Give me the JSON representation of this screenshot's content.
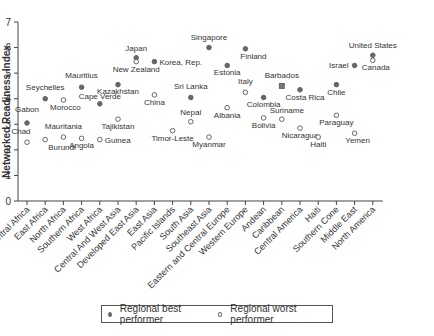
{
  "chart_data": {
    "type": "scatter",
    "title": "",
    "xlabel": "",
    "ylabel": "Networked Readiness Index",
    "ylim": [
      0,
      7
    ],
    "yticks": [
      0,
      1,
      2,
      3,
      4,
      5,
      6,
      7
    ],
    "grid": false,
    "legend_position": "bottom",
    "categories": [
      "Central Africa",
      "East Africa",
      "North Africa",
      "Southern Africa",
      "West Africa",
      "Central And West Asia",
      "Developed East Asia",
      "East Asia",
      "Pacific Islands",
      "South Asia",
      "Southeast Asia",
      "Eastern and Central Europe",
      "Western Europe",
      "Andean",
      "Caribbean",
      "Central America",
      "Haiti",
      "Southern Cone",
      "Middle East",
      "North America"
    ],
    "series": [
      {
        "name": "Regional best performer",
        "marker": "filled",
        "points": [
          {
            "category": "Central Africa",
            "label": "Gabon",
            "value": 3.05
          },
          {
            "category": "East Africa",
            "label": "Seychelles",
            "value": 4.0
          },
          {
            "category": "Southern Africa",
            "label": "Mauritius",
            "value": 4.45
          },
          {
            "category": "West Africa",
            "label": "Cape Verde",
            "value": 3.8
          },
          {
            "category": "Central And West Asia",
            "label": "Kazakhstan",
            "value": 4.55
          },
          {
            "category": "Developed East Asia",
            "label": "Japan",
            "value": 5.6
          },
          {
            "category": "East Asia",
            "label": "Korea, Rep.",
            "value": 5.45
          },
          {
            "category": "South Asia",
            "label": "Sri Lanka",
            "value": 4.05
          },
          {
            "category": "Southeast Asia",
            "label": "Singapore",
            "value": 6.0
          },
          {
            "category": "Eastern and Central Europe",
            "label": "Estonia",
            "value": 5.3
          },
          {
            "category": "Western Europe",
            "label": "Finland",
            "value": 5.95
          },
          {
            "category": "Andean",
            "label": "Colombia",
            "value": 4.05
          },
          {
            "category": "Caribbean",
            "label": "Barbados",
            "value": 4.5
          },
          {
            "category": "Central America",
            "label": "Costa Rica",
            "value": 4.35
          },
          {
            "category": "Southern Cone",
            "label": "Chile",
            "value": 4.55
          },
          {
            "category": "Middle East",
            "label": "Israel",
            "value": 5.3
          },
          {
            "category": "North America",
            "label": "United States",
            "value": 5.7
          }
        ]
      },
      {
        "name": "Regional worst performer",
        "marker": "hollow",
        "points": [
          {
            "category": "Central Africa",
            "label": "Chad",
            "value": 2.3
          },
          {
            "category": "East Africa",
            "label": "Burundi",
            "value": 2.4
          },
          {
            "category": "North Africa",
            "label": "Morocco",
            "value": 3.95
          },
          {
            "category": "North Africa",
            "label": "Mauritania",
            "value": 2.5
          },
          {
            "category": "Southern Africa",
            "label": "Angola",
            "value": 2.45
          },
          {
            "category": "West Africa",
            "label": "Guinea",
            "value": 2.4
          },
          {
            "category": "Central And West Asia",
            "label": "Tajikistan",
            "value": 3.2
          },
          {
            "category": "Developed East Asia",
            "label": "New Zealand",
            "value": 5.45
          },
          {
            "category": "East Asia",
            "label": "China",
            "value": 4.15
          },
          {
            "category": "Pacific Islands",
            "label": "Timor-Leste",
            "value": 2.75
          },
          {
            "category": "South Asia",
            "label": "Nepal",
            "value": 3.1
          },
          {
            "category": "Southeast Asia",
            "label": "Myanmar",
            "value": 2.5
          },
          {
            "category": "Eastern and Central Europe",
            "label": "Albania",
            "value": 3.65
          },
          {
            "category": "Western Europe",
            "label": "Italy",
            "value": 4.25
          },
          {
            "category": "Andean",
            "label": "Bolivia",
            "value": 3.25
          },
          {
            "category": "Caribbean",
            "label": "Suriname",
            "value": 3.2
          },
          {
            "category": "Central America",
            "label": "Nicaragua",
            "value": 2.85
          },
          {
            "category": "Haiti",
            "label": "Haiti",
            "value": 2.5
          },
          {
            "category": "Southern Cone",
            "label": "Paraguay",
            "value": 3.35
          },
          {
            "category": "Middle East",
            "label": "Yemen",
            "value": 2.65
          },
          {
            "category": "North America",
            "label": "Canada",
            "value": 5.5
          }
        ]
      }
    ]
  },
  "legend": {
    "best_label": "Regional best performer",
    "worst_label": "Regional worst performer"
  }
}
